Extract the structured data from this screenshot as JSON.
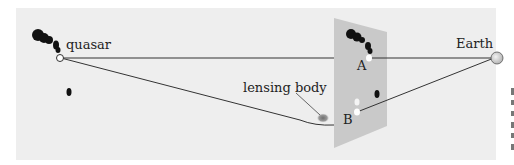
{
  "diagram": {
    "labels": {
      "quasar": "quasar",
      "earth": "Earth",
      "lensing_body": "lensing body",
      "image_a": "A",
      "image_b": "B"
    },
    "colors": {
      "background_panel": "#eeeeee",
      "image_plane": "#c8c8c8",
      "ray": "#333333",
      "blob": "#111111",
      "lens": "#777777",
      "earth_fill": "#d9d9d9"
    },
    "right_margin_marks": [
      "",
      "",
      "",
      "",
      "",
      ""
    ]
  }
}
